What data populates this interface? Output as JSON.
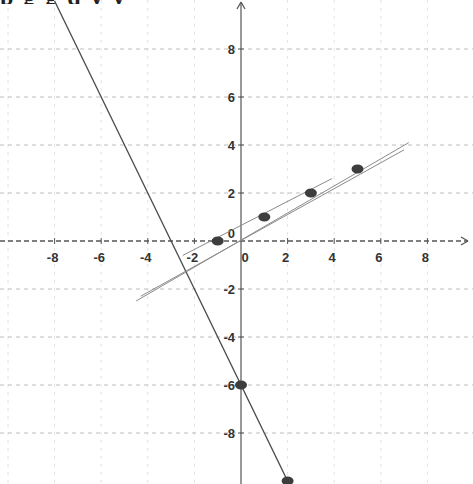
{
  "header": {
    "cropped_text": "p g g q y y"
  },
  "chart_data": {
    "type": "line",
    "title": "",
    "xlabel": "",
    "ylabel": "",
    "xlim": [
      -10.3,
      10
    ],
    "ylim": [
      -10.1,
      10.1
    ],
    "grid": true,
    "x_ticks": [
      -8,
      -6,
      -4,
      -2,
      0,
      2,
      4,
      6,
      8
    ],
    "y_ticks": [
      8,
      6,
      4,
      2,
      -2,
      -4,
      -6,
      -8
    ],
    "x_tick_labels": [
      "-8",
      "-6",
      "-4",
      "-2",
      "0",
      "2",
      "4",
      "6",
      "8"
    ],
    "y_tick_labels": [
      "8",
      "6",
      "4",
      "2",
      "-2",
      "-4",
      "-6",
      "-8"
    ],
    "series": [
      {
        "name": "steep line y = -2x - 6",
        "kind": "line",
        "x": [
          -8.0,
          2.1
        ],
        "y": [
          10.0,
          -10.2
        ]
      },
      {
        "name": "fit line 1",
        "kind": "line",
        "x": [
          -4.5,
          7.2
        ],
        "y": [
          -2.5,
          4.1
        ]
      },
      {
        "name": "fit line 2",
        "kind": "line",
        "x": [
          -4.3,
          7.0
        ],
        "y": [
          -2.3,
          3.8
        ]
      },
      {
        "name": "fit line 3",
        "kind": "line",
        "x": [
          -2.5,
          3.9
        ],
        "y": [
          -0.6,
          2.6
        ]
      },
      {
        "name": "plotted points",
        "kind": "scatter",
        "x": [
          -1,
          1,
          3,
          5
        ],
        "y": [
          0,
          1,
          2,
          3
        ]
      },
      {
        "name": "steep line points",
        "kind": "scatter",
        "x": [
          0,
          2
        ],
        "y": [
          -6,
          -10
        ]
      }
    ]
  }
}
